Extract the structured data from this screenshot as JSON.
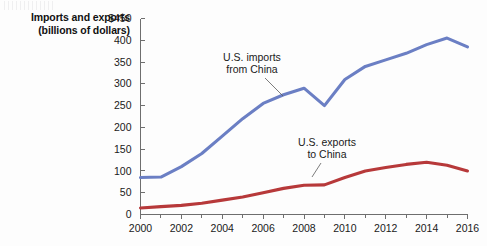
{
  "axis_title": {
    "line1": "Imports and exports",
    "line2": "(billions of dollars)"
  },
  "annotations": {
    "imports": {
      "line1": "U.S. imports",
      "line2": "from China"
    },
    "exports": {
      "line1": "U.S. exports",
      "line2": "to China"
    }
  },
  "colors": {
    "imports_line": "#6b7fc4",
    "exports_line": "#b7393a",
    "axis": "#6e6e6e",
    "text": "#1a1a1a",
    "background": "#fdfdfd"
  },
  "chart_data": {
    "type": "line",
    "title": "",
    "subtitle": "",
    "xlabel": "",
    "ylabel": "Imports and exports (billions of dollars)",
    "ylim": [
      0,
      450
    ],
    "xlim": [
      2000,
      2016
    ],
    "ytick_labels": [
      "$450",
      "400",
      "350",
      "300",
      "250",
      "200",
      "150",
      "100",
      "50",
      "0"
    ],
    "ytick_values": [
      450,
      400,
      350,
      300,
      250,
      200,
      150,
      100,
      50,
      0
    ],
    "xtick_labels": [
      "2000",
      "2002",
      "2004",
      "2006",
      "2008",
      "2010",
      "2012",
      "2014",
      "2016"
    ],
    "xtick_values": [
      2000,
      2002,
      2004,
      2006,
      2008,
      2010,
      2012,
      2014,
      2016
    ],
    "xtick_minor_values": [
      2001,
      2003,
      2005,
      2007,
      2009,
      2011,
      2013,
      2015
    ],
    "grid": false,
    "legend": "annotated-inline",
    "x": [
      2000,
      2001,
      2002,
      2003,
      2004,
      2005,
      2006,
      2007,
      2008,
      2009,
      2010,
      2011,
      2012,
      2013,
      2014,
      2015,
      2016
    ],
    "series": [
      {
        "name": "U.S. imports from China",
        "color": "#6b7fc4",
        "values": [
          85,
          86,
          110,
          140,
          180,
          220,
          255,
          275,
          290,
          250,
          310,
          340,
          355,
          370,
          390,
          405,
          385
        ]
      },
      {
        "name": "U.S. exports to China",
        "color": "#b7393a",
        "values": [
          15,
          18,
          21,
          26,
          33,
          40,
          50,
          60,
          67,
          68,
          85,
          100,
          108,
          115,
          120,
          113,
          100
        ]
      }
    ]
  }
}
